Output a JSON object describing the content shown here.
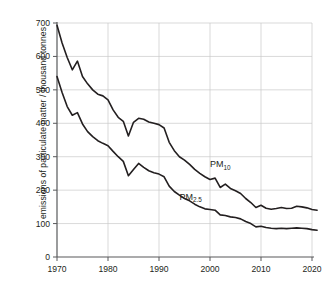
{
  "chart_data": {
    "type": "line",
    "title": "",
    "subtitle": "",
    "xlabel": "",
    "ylabel": "emissions of particulate matter / thousand tonnes",
    "xlim": [
      1968,
      2022
    ],
    "ylim": [
      0,
      700
    ],
    "xticks": [
      1970,
      1980,
      1990,
      2000,
      2010,
      2020
    ],
    "xtick_labels": [
      "1970",
      "1980",
      "1990",
      "2000",
      "2010",
      "2020"
    ],
    "yticks": [
      0,
      100,
      200,
      300,
      400,
      500,
      600,
      700
    ],
    "ytick_labels": [
      "0",
      "100",
      "200",
      "300",
      "400",
      "500",
      "600",
      "700"
    ],
    "grid": "horizontal-and-vertical",
    "legend_position": "inline-annotation",
    "line_color": "#231f20",
    "grid_color": "#c9c9c9",
    "axis_color": "#58595b",
    "annotations": [
      {
        "text": "PM",
        "sub": "10",
        "x": 2000,
        "y": 268
      },
      {
        "text": "PM",
        "sub": "2.5",
        "x": 1994,
        "y": 172
      }
    ],
    "x": [
      1970,
      1971,
      1972,
      1973,
      1974,
      1975,
      1976,
      1977,
      1978,
      1979,
      1980,
      1981,
      1982,
      1983,
      1984,
      1985,
      1986,
      1987,
      1988,
      1989,
      1990,
      1991,
      1992,
      1993,
      1994,
      1995,
      1996,
      1997,
      1998,
      1999,
      2000,
      2001,
      2002,
      2003,
      2004,
      2005,
      2006,
      2007,
      2008,
      2009,
      2010,
      2011,
      2012,
      2013,
      2014,
      2015,
      2016,
      2017,
      2018,
      2019,
      2020,
      2021
    ],
    "series": [
      {
        "name": "PM10",
        "values": [
          693,
          640,
          597,
          560,
          586,
          540,
          518,
          500,
          487,
          482,
          470,
          440,
          418,
          406,
          362,
          403,
          415,
          412,
          404,
          400,
          396,
          386,
          343,
          318,
          300,
          290,
          277,
          262,
          250,
          240,
          232,
          236,
          208,
          218,
          205,
          198,
          190,
          175,
          163,
          148,
          155,
          146,
          143,
          145,
          148,
          145,
          146,
          152,
          150,
          147,
          142,
          140
        ]
      },
      {
        "name": "PM2.5",
        "values": [
          540,
          492,
          450,
          424,
          432,
          398,
          375,
          360,
          348,
          340,
          333,
          316,
          300,
          286,
          243,
          262,
          280,
          268,
          258,
          252,
          248,
          240,
          212,
          196,
          185,
          175,
          168,
          158,
          150,
          144,
          142,
          140,
          126,
          124,
          120,
          118,
          114,
          106,
          100,
          90,
          92,
          88,
          86,
          85,
          86,
          85,
          86,
          87,
          86,
          85,
          82,
          80
        ]
      }
    ]
  },
  "layout": {
    "plot_left": 57,
    "plot_right": 312,
    "plot_top": 23,
    "plot_bottom": 257
  }
}
